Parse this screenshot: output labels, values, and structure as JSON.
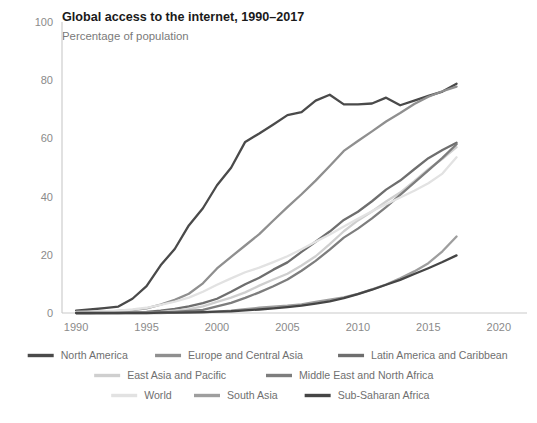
{
  "header": {
    "title": "Global access to the internet, 1990–2017",
    "subtitle": "Percentage of population"
  },
  "chart_data": {
    "type": "line",
    "title": "Global access to the internet, 1990–2017",
    "subtitle": "Percentage of population",
    "xlabel": "",
    "ylabel": "",
    "xlim": [
      1989,
      2022
    ],
    "ylim": [
      0,
      100
    ],
    "grid": false,
    "legend_position": "bottom",
    "x_ticks": [
      1990,
      1995,
      2000,
      2005,
      2010,
      2015,
      2020
    ],
    "y_ticks": [
      0,
      20,
      40,
      60,
      80,
      100
    ],
    "x": [
      1990,
      1991,
      1992,
      1993,
      1994,
      1995,
      1996,
      1997,
      1998,
      1999,
      2000,
      2001,
      2002,
      2003,
      2004,
      2005,
      2006,
      2007,
      2008,
      2009,
      2010,
      2011,
      2012,
      2013,
      2014,
      2015,
      2016,
      2017
    ],
    "series": [
      {
        "name": "North America",
        "color": "#4a4a4a",
        "values": [
          0.8,
          1.2,
          1.7,
          2.2,
          4.9,
          9.2,
          16.4,
          22.0,
          30.1,
          36.0,
          43.9,
          49.9,
          58.8,
          61.7,
          64.8,
          68.0,
          69.0,
          73.0,
          75.0,
          71.7,
          71.7,
          72.0,
          74.0,
          71.4,
          73.0,
          74.6,
          76.1,
          78.8
        ]
      },
      {
        "name": "Europe and Central Asia",
        "color": "#8f8f8f",
        "values": [
          0.3,
          0.4,
          0.5,
          0.7,
          1.0,
          1.6,
          2.9,
          4.5,
          6.6,
          10.2,
          15.3,
          19.3,
          23.2,
          27.1,
          31.8,
          36.4,
          40.8,
          45.5,
          50.5,
          55.7,
          59.1,
          62.4,
          65.8,
          68.7,
          71.8,
          74.3,
          76.2,
          77.8
        ]
      },
      {
        "name": "Latin America and Caribbean",
        "color": "#6e6e6e",
        "values": [
          0.0,
          0.0,
          0.1,
          0.1,
          0.2,
          0.4,
          0.8,
          1.4,
          2.3,
          3.4,
          4.9,
          7.3,
          9.9,
          12.1,
          14.9,
          17.4,
          21.0,
          24.5,
          28.0,
          32.0,
          34.8,
          38.4,
          42.4,
          45.5,
          49.4,
          53.2,
          56.0,
          58.5
        ]
      },
      {
        "name": "East Asia and Pacific",
        "color": "#cfcfcf",
        "values": [
          0.0,
          0.0,
          0.0,
          0.1,
          0.1,
          0.2,
          0.4,
          0.8,
          1.3,
          2.3,
          3.8,
          5.3,
          7.1,
          9.4,
          11.5,
          13.5,
          16.3,
          19.5,
          23.7,
          28.1,
          31.8,
          34.9,
          38.3,
          41.4,
          45.3,
          49.4,
          53.0,
          57.0
        ]
      },
      {
        "name": "Middle East and North Africa",
        "color": "#7d7d7d",
        "values": [
          0.0,
          0.0,
          0.0,
          0.0,
          0.1,
          0.1,
          0.2,
          0.4,
          0.7,
          1.1,
          2.3,
          3.5,
          5.2,
          7.1,
          9.2,
          11.5,
          14.5,
          17.9,
          21.8,
          25.9,
          29.0,
          32.5,
          36.4,
          40.6,
          44.8,
          49.0,
          53.3,
          58.0
        ]
      },
      {
        "name": "World",
        "color": "#e2e2e2",
        "values": [
          0.4,
          0.5,
          0.6,
          0.8,
          1.2,
          1.8,
          2.8,
          3.9,
          5.3,
          7.3,
          9.7,
          11.9,
          14.0,
          15.6,
          17.5,
          19.5,
          21.9,
          24.5,
          27.0,
          29.7,
          32.4,
          35.0,
          37.4,
          39.7,
          42.0,
          44.6,
          47.9,
          53.5
        ]
      },
      {
        "name": "South Asia",
        "color": "#9e9e9e",
        "values": [
          0.0,
          0.0,
          0.0,
          0.0,
          0.0,
          0.0,
          0.0,
          0.1,
          0.1,
          0.2,
          0.5,
          0.8,
          1.3,
          1.8,
          2.2,
          2.5,
          3.0,
          3.8,
          4.6,
          5.4,
          6.6,
          8.1,
          9.8,
          11.9,
          14.3,
          17.1,
          21.2,
          26.3
        ]
      },
      {
        "name": "Sub-Saharan Africa",
        "color": "#454545",
        "values": [
          0.0,
          0.0,
          0.0,
          0.0,
          0.0,
          0.0,
          0.1,
          0.1,
          0.2,
          0.3,
          0.5,
          0.6,
          0.9,
          1.2,
          1.6,
          2.0,
          2.5,
          3.2,
          4.0,
          5.1,
          6.5,
          8.0,
          9.7,
          11.4,
          13.4,
          15.4,
          17.5,
          19.8
        ]
      }
    ]
  },
  "legend": {
    "rows": [
      [
        "North America",
        "Europe and Central Asia",
        "Latin America and Caribbean"
      ],
      [
        "East Asia and Pacific",
        "Middle East and North Africa"
      ],
      [
        "World",
        "South Asia",
        "Sub-Saharan Africa"
      ]
    ]
  }
}
